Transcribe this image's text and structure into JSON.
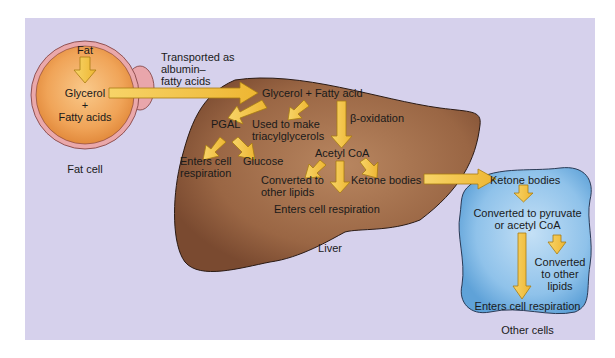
{
  "colors": {
    "background_panel": "#d6d1ec",
    "fat_cell_rim": "#e8a6a8",
    "fat_cell_fill": "#f1a85a",
    "liver_fill": "#9c6a48",
    "other_cells_fill": "#8ec2ea",
    "arrow_fill": "#f3c242",
    "arrow_stroke": "#a87c12",
    "outline": "#3a2a2a"
  },
  "fat_cell": {
    "fat": "Fat",
    "glycerol": "Glycerol",
    "plus": "+",
    "fatty_acids": "Fatty acids",
    "caption": "Fat cell"
  },
  "transport": {
    "line1": "Transported as",
    "line2": "albumin–",
    "line3": "fatty acids"
  },
  "liver": {
    "glycerol_fatty_acid": "Glycerol + Fatty acid",
    "pgal": "PGAL",
    "used_to_make_1": "Used to make",
    "used_to_make_2": "triacylglycerols",
    "beta_oxidation": "β-oxidation",
    "enters_cell_1": "Enters cell",
    "enters_cell_2": "respiration",
    "glucose": "Glucose",
    "acetyl_coa": "Acetyl CoA",
    "converted_1": "Converted to",
    "converted_2": "other lipids",
    "ketone_bodies": "Ketone bodies",
    "enters_cell_respiration": "Enters cell respiration",
    "caption": "Liver"
  },
  "other_cells": {
    "ketone_bodies": "Ketone bodies",
    "converted_pyruvate_1": "Converted to pyruvate",
    "converted_pyruvate_2": "or acetyl CoA",
    "converted_lipids_1": "Converted",
    "converted_lipids_2": "to other",
    "converted_lipids_3": "lipids",
    "enters_cell_respiration": "Enters cell respiration",
    "caption": "Other cells"
  }
}
